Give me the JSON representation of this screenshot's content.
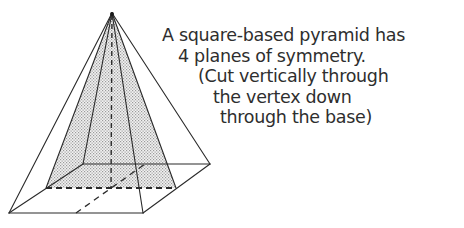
{
  "figure": {
    "caption_lines": [
      "A square-based pyramid has",
      "4 planes of symmetry.",
      "(Cut vertically through",
      "the vertex down",
      "through the base)"
    ],
    "colors": {
      "line": "#2a2a2a",
      "shading": "#bdbdbd",
      "text": "#2e2e2e",
      "background": "#ffffff"
    }
  }
}
